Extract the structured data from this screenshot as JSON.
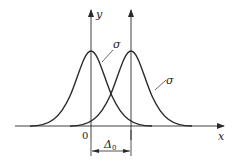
{
  "diagram": {
    "title": "",
    "axes": {
      "x_label": "x",
      "y_label": "y",
      "origin_label": "0"
    },
    "curves": [
      {
        "name": "left-gaussian",
        "center_label": "0",
        "sigma_label": "σ"
      },
      {
        "name": "right-gaussian",
        "center_label": "Δ0",
        "sigma_label": "σ"
      }
    ],
    "offset": {
      "symbol": "Δ",
      "subscript": "0"
    },
    "colors": {
      "line": "#2a2a2a",
      "background": "#ffffff"
    }
  }
}
